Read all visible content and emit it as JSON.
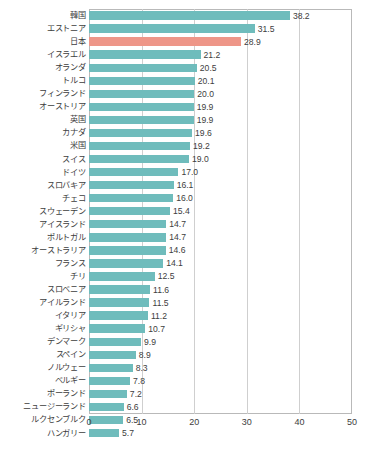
{
  "chart_data": {
    "type": "bar",
    "orientation": "horizontal",
    "title": "",
    "subtitle": "",
    "xlabel": "",
    "ylabel": "",
    "xlim": [
      0,
      50
    ],
    "xticks": [
      "0",
      "10",
      "20",
      "30",
      "40",
      "50"
    ],
    "xtick_values": [
      0,
      10,
      20,
      30,
      40,
      50
    ],
    "grid": "vertical gridlines at 10, 20, 30, 40",
    "legend": "none",
    "series_color": "#6fbcbc",
    "highlight_color": "#ee9688",
    "highlight_category": "日本",
    "data_labels": true,
    "categories": [
      "韓国",
      "エストニア",
      "日本",
      "イスラエル",
      "オランダ",
      "トルコ",
      "フィンランド",
      "オーストリア",
      "英国",
      "カナダ",
      "米国",
      "スイス",
      "ドイツ",
      "スロバキア",
      "チェコ",
      "スウェーデン",
      "アイスランド",
      "ポルトガル",
      "オーストラリア",
      "フランス",
      "チリ",
      "スロベニア",
      "アイルランド",
      "イタリア",
      "ギリシャ",
      "デンマーク",
      "スペイン",
      "ノルウェー",
      "ベルギー",
      "ポーランド",
      "ニュージーランド",
      "ルクセンブルク",
      "ハンガリー"
    ],
    "values": [
      38.2,
      31.5,
      28.9,
      21.2,
      20.5,
      20.1,
      20.0,
      19.9,
      19.9,
      19.6,
      19.2,
      19.0,
      17.0,
      16.1,
      16.0,
      15.4,
      14.7,
      14.7,
      14.6,
      14.1,
      12.5,
      11.6,
      11.5,
      11.2,
      10.7,
      9.9,
      8.9,
      8.3,
      7.8,
      7.2,
      6.6,
      6.5,
      5.7
    ],
    "value_labels": [
      "38.2",
      "31.5",
      "28.9",
      "21.2",
      "20.5",
      "20.1",
      "20.0",
      "19.9",
      "19.9",
      "19.6",
      "19.2",
      "19.0",
      "17.0",
      "16.1",
      "16.0",
      "15.4",
      "14.7",
      "14.7",
      "14.6",
      "14.1",
      "12.5",
      "11.6",
      "11.5",
      "11.2",
      "10.7",
      "9.9",
      "8.9",
      "8.3",
      "7.8",
      "7.2",
      "6.6",
      "6.5",
      "5.7"
    ]
  }
}
